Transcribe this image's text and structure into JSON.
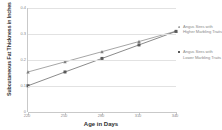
{
  "chart_data": {
    "type": "scatter",
    "title": "",
    "xlabel": "Age in Days",
    "ylabel": "Subcutaneous Fat Thickness in Inches",
    "xlim": [
      220,
      340
    ],
    "ylim": [
      0,
      0.4
    ],
    "xticks": [
      "220",
      "250",
      "280",
      "310",
      "340"
    ],
    "yticks": [
      "0.4",
      "0.3",
      "0.2",
      "0.1",
      "0"
    ],
    "grid": true,
    "legend_position": "right",
    "x": [
      220,
      250,
      280,
      310,
      340
    ],
    "series": [
      {
        "name": "Angus Sires with Higher Marbling Traits",
        "color": "#7f7f7f",
        "marker": "triangle",
        "values": [
          0.154,
          0.193,
          0.232,
          0.271,
          0.311
        ]
      },
      {
        "name": "Angus Sires with Lower Marbling Traits",
        "color": "#595959",
        "marker": "square",
        "values": [
          0.101,
          0.154,
          0.206,
          0.258,
          0.31
        ]
      }
    ]
  },
  "legend": {
    "entries": [
      {
        "label": "Angus Sires with Higher Marbling Traits",
        "color": "#7f7f7f"
      },
      {
        "label": "Angus Sires with Lower Marbling Traits",
        "color": "#595959"
      }
    ]
  },
  "colors": {
    "grid": "#e2e2e2",
    "axis": "#c9c9c9",
    "tick_text": "#8a8a8a",
    "title_text": "#2f2f2f",
    "background": "#ffffff"
  }
}
